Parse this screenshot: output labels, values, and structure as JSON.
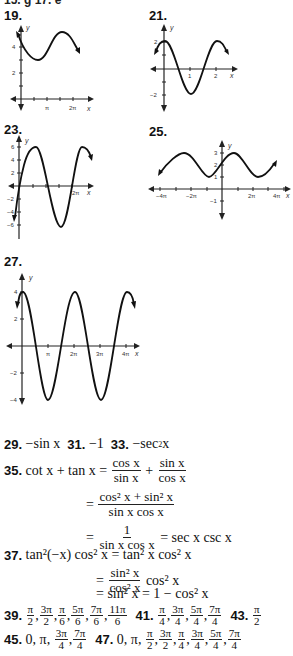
{
  "header": {
    "cut_text": "15. g   17. e"
  },
  "graphs": [
    {
      "label": "19.",
      "xticks": [
        "π",
        "2π"
      ],
      "yticks": [
        "4",
        "2"
      ],
      "xlabel": "x",
      "ylabel": "y"
    },
    {
      "label": "21.",
      "xticks": [
        "1",
        "2"
      ],
      "yticks": [
        "2",
        "−2"
      ],
      "xlabel": "x",
      "ylabel": "y"
    },
    {
      "label": "23.",
      "xticks": [
        "2π"
      ],
      "yticks": [
        "6",
        "4",
        "2",
        "−2",
        "−4",
        "−6"
      ],
      "xlabel": "x",
      "ylabel": "y"
    },
    {
      "label": "25.",
      "xticks": [
        "−4π",
        "−2π",
        "2π",
        "4π"
      ],
      "yticks": [
        "3",
        "2",
        "1",
        "−1"
      ],
      "xlabel": "x",
      "ylabel": "y"
    },
    {
      "label": "27.",
      "xticks": [
        "π",
        "2π",
        "3π",
        "4π"
      ],
      "yticks": [
        "4",
        "2",
        "−2",
        "−4"
      ],
      "xlabel": "x",
      "ylabel": "y"
    }
  ],
  "answers": {
    "a29": {
      "num": "29.",
      "text": "−sin x"
    },
    "a31": {
      "num": "31.",
      "text": "−1"
    },
    "a33": {
      "num": "33.",
      "text": "−sec",
      "tail": " x"
    },
    "a35": {
      "num": "35.",
      "lhs": "cot x + tan x =",
      "f1n": "cos x",
      "f1d": "sin x",
      "plus": "+",
      "f2n": "sin x",
      "f2d": "cos x",
      "eq": "=",
      "f3n": "cos² x + sin² x",
      "f3d": "sin x cos x",
      "f4n": "1",
      "f4d": "sin x cos x",
      "result": "= sec x csc x"
    },
    "a37": {
      "num": "37.",
      "lhs": "tan²(−x) cos² x = tan² x cos² x",
      "eq": "=",
      "f1n": "sin² x",
      "f1d": "cos² x",
      "tail": "cos² x",
      "line3": "= sin² x = 1 − cos² x"
    },
    "a39": {
      "num": "39.",
      "vals": [
        [
          "π",
          "2"
        ],
        [
          "3π",
          "2"
        ],
        [
          "π",
          "6"
        ],
        [
          "5π",
          "6"
        ],
        [
          "7π",
          "6"
        ],
        [
          "11π",
          "6"
        ]
      ]
    },
    "a41": {
      "num": "41.",
      "vals": [
        [
          "π",
          "4"
        ],
        [
          "3π",
          "4"
        ],
        [
          "5π",
          "4"
        ],
        [
          "7π",
          "4"
        ]
      ]
    },
    "a43": {
      "num": "43.",
      "vals": [
        [
          "π",
          "2"
        ]
      ]
    },
    "a45": {
      "num": "45.",
      "prefix": "0, π,",
      "vals": [
        [
          "3π",
          "4"
        ],
        [
          "7π",
          "4"
        ]
      ]
    },
    "a47": {
      "num": "47.",
      "prefix": "0, π,",
      "vals": [
        [
          "π",
          "2"
        ],
        [
          "3π",
          "2"
        ],
        [
          "π",
          "4"
        ],
        [
          "3π",
          "4"
        ],
        [
          "5π",
          "4"
        ],
        [
          "7π",
          "4"
        ]
      ]
    }
  }
}
